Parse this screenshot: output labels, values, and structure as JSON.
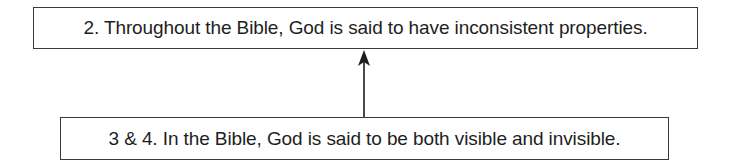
{
  "diagram": {
    "nodes": [
      {
        "id": "claim",
        "label": "2. Throughout the Bible, God is said to have inconsistent properties."
      },
      {
        "id": "premise",
        "label": "3 & 4. In the Bible, God is said to be both visible and invisible."
      }
    ],
    "edges": [
      {
        "from": "premise",
        "to": "claim",
        "type": "supports"
      }
    ],
    "colors": {
      "stroke": "#1e1e1e",
      "background": "#ffffff"
    }
  }
}
